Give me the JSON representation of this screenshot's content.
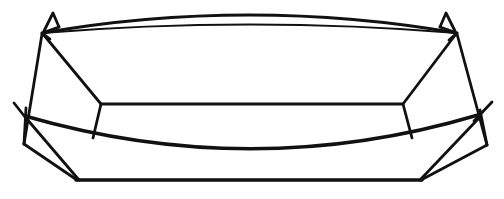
{
  "figure": {
    "title": "Line drawing of an open boat-shaped vessel",
    "background_color": "#ffffff",
    "stroke_color": "#111111",
    "width": 504,
    "height": 199,
    "style": "monochrome line art",
    "parts": [
      {
        "name": "upper-rim-arc",
        "label": "Upper rim arc",
        "path": "M 42 33 Q 249 -3 457 33",
        "weight": "w-med"
      },
      {
        "name": "upper-rim-chord",
        "label": "Upper rim chord",
        "path": "M 42 33 Q 250 16 457 33",
        "weight": "w-thin"
      },
      {
        "name": "left-horn",
        "label": "Left pointed tip",
        "path": "M 44 31 L 53 13 L 59 27",
        "weight": "w-med"
      },
      {
        "name": "right-horn",
        "label": "Right pointed tip",
        "path": "M 440 27 L 446 13 L 455 31",
        "weight": "w-med"
      },
      {
        "name": "left-corner-notch",
        "label": "Left corner notch",
        "path": "M 59 27 L 42 33 L 50 39",
        "weight": "w-med"
      },
      {
        "name": "right-corner-notch",
        "label": "Right corner notch",
        "path": "M 440 27 L 457 33 L 449 40",
        "weight": "w-med"
      },
      {
        "name": "left-outer-side-edge",
        "label": "Left outer side edge",
        "path": "M 42 34 L 24 144",
        "weight": "w-med"
      },
      {
        "name": "right-outer-side-edge",
        "label": "Right outer side edge",
        "path": "M 457 34 L 487 145",
        "weight": "w-med"
      },
      {
        "name": "left-inner-fold",
        "label": "Left inner fold",
        "path": "M 43 34 L 101 104",
        "weight": "w-med"
      },
      {
        "name": "right-inner-fold",
        "label": "Right inner fold",
        "path": "M 456 34 L 403 104",
        "weight": "w-med"
      },
      {
        "name": "inner-panel-top-edge",
        "label": "Inner panel top edge",
        "path": "M 101 104 L 403 104",
        "weight": "w-med"
      },
      {
        "name": "inner-panel-left-edge",
        "label": "Inner panel left edge",
        "path": "M 101 104 L 93 138",
        "weight": "w-med"
      },
      {
        "name": "inner-panel-right-edge",
        "label": "Inner panel right edge",
        "path": "M 403 104 L 412 138",
        "weight": "w-med"
      },
      {
        "name": "lower-rim-arc",
        "label": "Lower rim sagging arc",
        "path": "M 25 116 Q 253 182 478 115",
        "weight": "w-thick"
      },
      {
        "name": "left-rim-tip",
        "label": "Left rim tip",
        "path": "M 14 103 L 29 122",
        "weight": "w-med"
      },
      {
        "name": "right-rim-tip",
        "label": "Right rim tip",
        "path": "M 492 102 L 474 121",
        "weight": "w-med"
      },
      {
        "name": "left-lower-vertical",
        "label": "Left lower vertical edge",
        "path": "M 26 108 L 24 144",
        "weight": "w-med"
      },
      {
        "name": "right-lower-vertical",
        "label": "Right lower vertical edge",
        "path": "M 480 110 L 487 145",
        "weight": "w-med"
      },
      {
        "name": "left-base-diagonal",
        "label": "Left base diagonal",
        "path": "M 24 144 L 77 180",
        "weight": "w-med"
      },
      {
        "name": "right-base-diagonal",
        "label": "Right base diagonal",
        "path": "M 487 145 L 421 180",
        "weight": "w-med"
      },
      {
        "name": "left-keel-diagonal",
        "label": "Left keel diagonal",
        "path": "M 26 118 L 79 180",
        "weight": "w-med"
      },
      {
        "name": "right-keel-diagonal",
        "label": "Right keel diagonal",
        "path": "M 479 118 L 420 180",
        "weight": "w-med"
      },
      {
        "name": "base-edge",
        "label": "Base edge",
        "path": "M 76 180 L 422 180",
        "weight": "w-thick"
      }
    ]
  }
}
